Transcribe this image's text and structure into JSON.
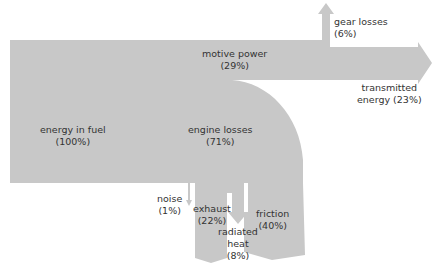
{
  "diagram": {
    "type": "sankey",
    "fill_color": "#c8c8c8",
    "nodes": [
      {
        "id": "fuel",
        "name": "energy in fuel",
        "value": "(100%)"
      },
      {
        "id": "motive",
        "name": "motive power",
        "value": "(29%)"
      },
      {
        "id": "gear",
        "name": "gear losses",
        "value": "(6%)"
      },
      {
        "id": "transmitted",
        "name": "transmitted",
        "name2": "energy (23%)"
      },
      {
        "id": "engine",
        "name": "engine losses",
        "value": "(71%)"
      },
      {
        "id": "noise",
        "name": "noise",
        "value": "(1%)"
      },
      {
        "id": "exhaust",
        "name": "exhaust",
        "value": "(22%)"
      },
      {
        "id": "radiated",
        "name": "radiated",
        "name2": "heat",
        "value": "(8%)"
      },
      {
        "id": "friction",
        "name": "friction",
        "value": "(40%)"
      }
    ]
  }
}
